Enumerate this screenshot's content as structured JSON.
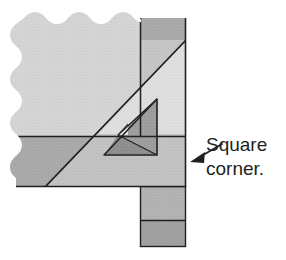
{
  "figure": {
    "background_color": "#ffffff",
    "annotation": {
      "line1": "Square",
      "line2": "corner.",
      "arrow_icon": "arrow-left-icon",
      "arrow_color": "#231f20",
      "text_color": "#231f20"
    },
    "colors": {
      "paper_light": "#d4d4d4",
      "paper_highlight": "#dcdcdc",
      "paper_medium": "#b9b9b9",
      "paper_mid_dark": "#a9a9a9",
      "paper_dark": "#9a9a9a",
      "paper_darkest": "#8e8e8e",
      "inner_light": "#e2e2e2",
      "inner_shade": "#9d9d9d",
      "outline": "#231f20"
    },
    "regions": [
      {
        "id": "upper-left-sheet",
        "label": "Upper left sheet with deckle edge",
        "fill": "#d4d4d4"
      },
      {
        "id": "upper-right-band",
        "label": "Upper right darker vertical band",
        "fill": "#a9a9a9"
      },
      {
        "id": "lower-left-band",
        "label": "Lower left darker horizontal band",
        "fill": "#a9a9a9"
      },
      {
        "id": "diagonal-fold-upper",
        "label": "Folded triangular flap above diagonal",
        "fill": "#dcdcdc"
      },
      {
        "id": "diagonal-fold-lower",
        "label": "Region below diagonal fold",
        "fill": "#c6c6c6"
      },
      {
        "id": "inner-triangle-light",
        "label": "Inner small triangle light face",
        "fill": "#e2e2e2"
      },
      {
        "id": "inner-triangle-shade",
        "label": "Inner small triangle shaded face",
        "fill": "#9d9d9d"
      },
      {
        "id": "inner-triangle-base",
        "label": "Inner small triangle base face",
        "fill": "#8e8e8e"
      },
      {
        "id": "bottom-tab-upper",
        "label": "Bottom tab upper section",
        "fill": "#b2b2b2"
      },
      {
        "id": "bottom-tab-lower",
        "label": "Bottom tab lower section",
        "fill": "#a0a0a0"
      }
    ],
    "measurements": {
      "sheet_left_x": 16,
      "sheet_right_x": 186,
      "sheet_top_y": 18,
      "sheet_bottom_y": 186,
      "band_split_x": 140,
      "band_split_y": 136,
      "tab_left_x": 140,
      "tab_right_x": 186,
      "tab_bottom_y": 247,
      "tab_split_y": 220,
      "diagonal_start": [
        45,
        186
      ],
      "diagonal_end": [
        186,
        40
      ]
    }
  }
}
